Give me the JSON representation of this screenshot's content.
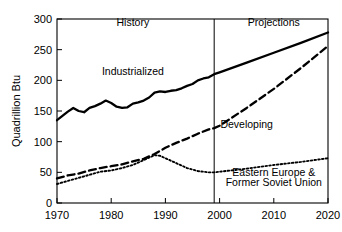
{
  "chart_data": {
    "type": "line",
    "title": "",
    "xlabel": "",
    "ylabel": "Quadrillion Btu",
    "xlim": [
      1970,
      2020
    ],
    "ylim": [
      0,
      300
    ],
    "x_ticks": [
      1970,
      1980,
      1990,
      2000,
      2010,
      2020
    ],
    "y_ticks": [
      0,
      50,
      100,
      150,
      200,
      250,
      300
    ],
    "grid": false,
    "legend_position": "inline-annotations",
    "divider_x": 1999,
    "annotations": [
      {
        "text": "History",
        "x": 1984,
        "y": 288
      },
      {
        "text": "Projections",
        "x": 2010,
        "y": 288
      },
      {
        "text": "Industrialized",
        "x": 1984,
        "y": 208
      },
      {
        "text": "Developing",
        "x": 2005,
        "y": 122
      },
      {
        "text": "Eastern Europe &",
        "x": 2010,
        "y": 44
      },
      {
        "text": "Former Soviet Union",
        "x": 2010,
        "y": 28
      }
    ],
    "series": [
      {
        "name": "Industrialized",
        "style": "solid",
        "x": [
          1970,
          1971,
          1972,
          1973,
          1974,
          1975,
          1976,
          1977,
          1978,
          1979,
          1980,
          1981,
          1982,
          1983,
          1984,
          1985,
          1986,
          1987,
          1988,
          1989,
          1990,
          1991,
          1992,
          1993,
          1994,
          1995,
          1996,
          1997,
          1998,
          1999,
          2000,
          2005,
          2010,
          2015,
          2020
        ],
        "values": [
          135,
          142,
          149,
          155,
          150,
          148,
          155,
          158,
          162,
          167,
          163,
          157,
          155,
          156,
          162,
          164,
          167,
          172,
          180,
          182,
          181,
          183,
          184,
          187,
          191,
          194,
          200,
          203,
          205,
          210,
          213,
          229,
          245,
          261,
          278
        ]
      },
      {
        "name": "Developing",
        "style": "dashed",
        "x": [
          1970,
          1972,
          1974,
          1976,
          1978,
          1980,
          1982,
          1984,
          1986,
          1988,
          1990,
          1992,
          1994,
          1996,
          1998,
          1999,
          2000,
          2005,
          2010,
          2015,
          2020
        ],
        "values": [
          40,
          45,
          48,
          53,
          57,
          60,
          63,
          68,
          72,
          80,
          90,
          98,
          105,
          113,
          120,
          122,
          126,
          155,
          186,
          220,
          256
        ]
      },
      {
        "name": "Eastern Europe & Former Soviet Union",
        "style": "dotted",
        "x": [
          1970,
          1972,
          1974,
          1976,
          1978,
          1980,
          1982,
          1984,
          1986,
          1988,
          1989,
          1990,
          1992,
          1994,
          1996,
          1998,
          1999,
          2000,
          2005,
          2010,
          2015,
          2020
        ],
        "values": [
          31,
          36,
          41,
          46,
          51,
          53,
          57,
          62,
          70,
          78,
          77,
          73,
          65,
          57,
          52,
          50,
          50,
          51,
          56,
          62,
          67,
          73
        ]
      }
    ]
  }
}
